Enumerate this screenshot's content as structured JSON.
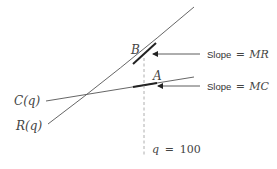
{
  "diagram": {
    "curves": {
      "revenue_label": "R(q)",
      "cost_label": "C(q)"
    },
    "points": {
      "B": "B",
      "A": "A"
    },
    "annotations": {
      "slope_mr_prefix": "Slope",
      "slope_mr_eq": "=",
      "slope_mr_value": "MR",
      "slope_mc_prefix": "Slope",
      "slope_mc_eq": "=",
      "slope_mc_value": "MC"
    },
    "vertical_marker": {
      "var": "q",
      "eq": "=",
      "value": "100"
    },
    "colors": {
      "line": "#555555",
      "tangent": "#222222",
      "dashed": "#999999"
    }
  }
}
